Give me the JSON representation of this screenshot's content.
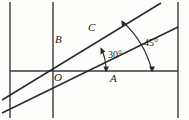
{
  "figure": {
    "kind": "geometry-diagram",
    "width": 189,
    "height": 120,
    "background_color": "#fdfdfc",
    "stroke_color": "#333333",
    "label_color": "#1a1a1a"
  },
  "points": {
    "origin": {
      "label": "O",
      "x": 53,
      "y": 71
    },
    "vertical_upper": {
      "label": "B",
      "x": 53,
      "y": 40
    },
    "ray_upper": {
      "label": "C",
      "x": 95,
      "y": 30
    },
    "horizontal_right": {
      "label": "A",
      "x": 114,
      "y": 71
    }
  },
  "angles": {
    "inner": {
      "label": "30°",
      "value": 30,
      "unit": "degrees",
      "from": "horizontal-line",
      "to": "shallow-ray"
    },
    "outer": {
      "label": "45°",
      "value": 45,
      "unit": "degrees",
      "from": "horizontal-line",
      "to": "steep-ray"
    }
  },
  "lines": {
    "horizontal": {
      "x1": 10,
      "y1": 71,
      "x2": 178,
      "y2": 71
    },
    "vertical_left": {
      "x1": 10,
      "y1": 2,
      "x2": 10,
      "y2": 118
    },
    "vertical_middle": {
      "x1": 53,
      "y1": 2,
      "x2": 53,
      "y2": 118
    },
    "vertical_right": {
      "x1": 178,
      "y1": 2,
      "x2": 178,
      "y2": 118
    },
    "ray_steep": {
      "x1": 2,
      "y1": 100,
      "x2": 161,
      "y2": 3
    },
    "ray_shallow": {
      "x1": 2,
      "y1": 113,
      "x2": 178,
      "y2": 27
    }
  }
}
